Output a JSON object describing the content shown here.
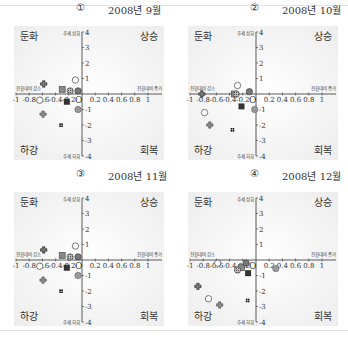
{
  "panels": [
    {
      "num": "①",
      "date": "2008년 9월"
    },
    {
      "num": "②",
      "date": "2008년 10월"
    },
    {
      "num": "③",
      "date": "2008년 11월"
    },
    {
      "num": "④",
      "date": "2008년 12월"
    }
  ],
  "quadrants": {
    "top_left": "둔화",
    "top_right": "상승",
    "bottom_left": "하강",
    "bottom_right": "회복"
  },
  "axis_labels": {
    "y_top": "추세 상회",
    "y_bottom": "추세 하회",
    "x_left": "전월대비 감소",
    "x_right": "전월대비 증가",
    "origin": "O"
  },
  "colors": {
    "plot_bg": "#ededed",
    "axis": "#333333",
    "marker_dark": "#333333",
    "marker_grey": "#9a9a9a"
  },
  "chart_data": [
    {
      "type": "scatter",
      "title": "① 2008년 9월",
      "xlabel": "전월대비 증감",
      "ylabel": "추세 대비",
      "xlim": [
        -1,
        1
      ],
      "ylim": [
        -4,
        4
      ],
      "xticks": [
        "-1",
        "-0.8",
        "-0.6",
        "-0.4",
        "-0.2",
        "0.2",
        "0.4",
        "0.6",
        "0.8",
        "1"
      ],
      "yticks": [
        "4",
        "3",
        "2",
        "1",
        "-1",
        "-2",
        "-3",
        "-4"
      ],
      "series": [
        {
          "name": "s1",
          "marker": "cross-outline",
          "x": -0.58,
          "y": 0.65
        },
        {
          "name": "s2",
          "marker": "cross-filled",
          "x": -0.59,
          "y": -1.3
        },
        {
          "name": "s3",
          "marker": "circle-open",
          "x": -0.64,
          "y": -0.4
        },
        {
          "name": "s4",
          "marker": "square-grey",
          "x": -0.3,
          "y": 0.3
        },
        {
          "name": "s5",
          "marker": "circle-hatched",
          "x": -0.18,
          "y": 0.2
        },
        {
          "name": "s6",
          "marker": "circle-dark",
          "x": -0.06,
          "y": 0.2
        },
        {
          "name": "s7",
          "marker": "square-dark",
          "x": -0.23,
          "y": -0.5
        },
        {
          "name": "s8",
          "marker": "circle-open",
          "x": -0.1,
          "y": 0.9
        },
        {
          "name": "s9",
          "marker": "circle-grey",
          "x": -0.06,
          "y": -1.0
        },
        {
          "name": "s10",
          "marker": "hash",
          "x": -0.32,
          "y": -2.0
        }
      ]
    },
    {
      "type": "scatter",
      "title": "② 2008년 10월",
      "xlim": [
        -1,
        1
      ],
      "ylim": [
        -4,
        4
      ],
      "series": [
        {
          "name": "s1",
          "marker": "cross-outline",
          "x": -0.82,
          "y": 0.0
        },
        {
          "name": "s2",
          "marker": "cross-filled",
          "x": -0.7,
          "y": -2.0
        },
        {
          "name": "s3",
          "marker": "circle-open",
          "x": -0.78,
          "y": -1.2
        },
        {
          "name": "s4",
          "marker": "square-grey",
          "x": -0.33,
          "y": 0.0
        },
        {
          "name": "s5",
          "marker": "circle-hatched",
          "x": -0.3,
          "y": 0.0
        },
        {
          "name": "s6",
          "marker": "circle-dark",
          "x": -0.1,
          "y": 0.15
        },
        {
          "name": "s7",
          "marker": "square-dark",
          "x": -0.22,
          "y": -0.8
        },
        {
          "name": "s8",
          "marker": "circle-open",
          "x": -0.28,
          "y": 0.55
        },
        {
          "name": "s9",
          "marker": "circle-grey",
          "x": -0.02,
          "y": -1.0
        },
        {
          "name": "s10",
          "marker": "hash",
          "x": -0.36,
          "y": -2.3
        }
      ]
    },
    {
      "type": "scatter",
      "title": "③ 2008년 11월",
      "xlim": [
        -1,
        1
      ],
      "ylim": [
        -4,
        4
      ],
      "series": [
        {
          "name": "s1",
          "marker": "cross-outline",
          "x": -0.58,
          "y": 0.65
        },
        {
          "name": "s2",
          "marker": "cross-filled",
          "x": -0.59,
          "y": -1.3
        },
        {
          "name": "s3",
          "marker": "circle-open",
          "x": -0.64,
          "y": -0.4
        },
        {
          "name": "s4",
          "marker": "square-grey",
          "x": -0.3,
          "y": 0.3
        },
        {
          "name": "s5",
          "marker": "circle-hatched",
          "x": -0.18,
          "y": 0.2
        },
        {
          "name": "s6",
          "marker": "circle-dark",
          "x": -0.06,
          "y": 0.2
        },
        {
          "name": "s7",
          "marker": "square-dark",
          "x": -0.23,
          "y": -0.5
        },
        {
          "name": "s8",
          "marker": "circle-open",
          "x": -0.1,
          "y": 0.9
        },
        {
          "name": "s9",
          "marker": "circle-grey",
          "x": -0.06,
          "y": -1.0
        },
        {
          "name": "s10",
          "marker": "hash",
          "x": -0.32,
          "y": -2.0
        }
      ]
    },
    {
      "type": "scatter",
      "title": "④ 2008년 12월",
      "xlim": [
        -1,
        1
      ],
      "ylim": [
        -4,
        4
      ],
      "series": [
        {
          "name": "s1",
          "marker": "cross-outline",
          "x": -0.88,
          "y": -1.7
        },
        {
          "name": "s2",
          "marker": "cross-filled",
          "x": -0.55,
          "y": -2.9
        },
        {
          "name": "s3",
          "marker": "circle-open",
          "x": -0.72,
          "y": -2.5
        },
        {
          "name": "s4",
          "marker": "square-grey",
          "x": -0.22,
          "y": -0.5
        },
        {
          "name": "s5",
          "marker": "circle-hatched",
          "x": -0.28,
          "y": -0.65
        },
        {
          "name": "s6",
          "marker": "circle-dark",
          "x": -0.15,
          "y": -0.2
        },
        {
          "name": "s7",
          "marker": "square-dark",
          "x": -0.12,
          "y": -0.85
        },
        {
          "name": "s8",
          "marker": "circle-open",
          "x": -0.58,
          "y": -0.2
        },
        {
          "name": "s9",
          "marker": "circle-grey",
          "x": 0.3,
          "y": -0.55
        },
        {
          "name": "s10",
          "marker": "hash",
          "x": -0.13,
          "y": -2.6
        }
      ]
    }
  ]
}
